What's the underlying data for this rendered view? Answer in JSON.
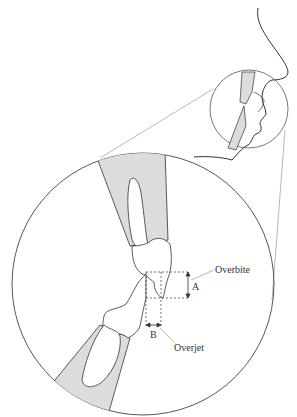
{
  "diagram": {
    "labels": {
      "overbite": "Overbite",
      "overjet": "Overjet",
      "a": "A",
      "b": "B"
    },
    "colors": {
      "line": "#333333",
      "gum_fill": "#dcdcdc",
      "guide_line": "#999999"
    }
  }
}
